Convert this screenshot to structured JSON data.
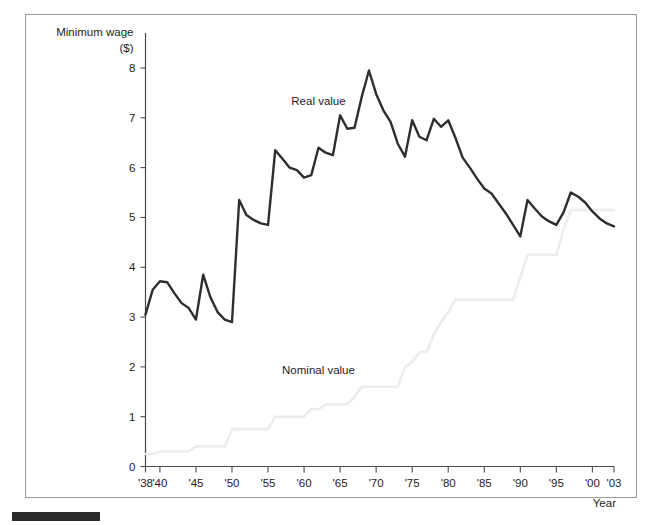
{
  "chart_data": {
    "type": "line",
    "title": "",
    "ylabel": "Minimum wage ($)",
    "ylabel_line1": "Minimum wage",
    "ylabel_line2": "($)",
    "xlabel": "Year",
    "xlim": [
      1938,
      2003
    ],
    "ylim": [
      0,
      8.3
    ],
    "grid": false,
    "legend_position": "inline-annotations",
    "y_ticks": [
      "0",
      "1",
      "2",
      "3",
      "4",
      "5",
      "6",
      "7",
      "8"
    ],
    "y_tick_values": [
      0,
      1,
      2,
      3,
      4,
      5,
      6,
      7,
      8
    ],
    "x_ticks": [
      "'38",
      "'40",
      "'45",
      "'50",
      "'55",
      "'60",
      "'65",
      "'70",
      "'75",
      "'80",
      "'85",
      "'90",
      "'95",
      "'00",
      "'03"
    ],
    "x_tick_values": [
      1938,
      1940,
      1945,
      1950,
      1955,
      1960,
      1965,
      1970,
      1975,
      1980,
      1985,
      1990,
      1995,
      2000,
      2003
    ],
    "colors": {
      "real": "#2e2e2e",
      "nominal": "#ececed",
      "axis": "#4a4a4a",
      "frame": "#9a9a9a",
      "text": "#1d1d1d"
    },
    "annotations": [
      {
        "name": "real-value-label",
        "text": "Real value",
        "x": 1962,
        "y": 7.25
      },
      {
        "name": "nominal-value-label",
        "text": "Nominal value",
        "x": 1962,
        "y": 1.85
      }
    ],
    "x": [
      1938,
      1939,
      1940,
      1941,
      1942,
      1943,
      1944,
      1945,
      1946,
      1947,
      1948,
      1949,
      1950,
      1951,
      1952,
      1953,
      1954,
      1955,
      1956,
      1957,
      1958,
      1959,
      1960,
      1961,
      1962,
      1963,
      1964,
      1965,
      1966,
      1967,
      1968,
      1969,
      1970,
      1971,
      1972,
      1973,
      1974,
      1975,
      1976,
      1977,
      1978,
      1979,
      1980,
      1981,
      1982,
      1983,
      1984,
      1985,
      1986,
      1987,
      1988,
      1989,
      1990,
      1991,
      1992,
      1993,
      1994,
      1995,
      1996,
      1997,
      1998,
      1999,
      2000,
      2001,
      2002,
      2003
    ],
    "series": [
      {
        "name": "Real value",
        "color": "#2e2e2e",
        "values": [
          3.05,
          3.55,
          3.72,
          3.7,
          3.48,
          3.28,
          3.18,
          2.95,
          3.85,
          3.4,
          3.1,
          2.95,
          2.9,
          5.35,
          5.05,
          4.95,
          4.88,
          4.85,
          6.35,
          6.18,
          6.0,
          5.95,
          5.8,
          5.85,
          6.4,
          6.3,
          6.25,
          7.05,
          6.78,
          6.8,
          7.42,
          7.95,
          7.48,
          7.15,
          6.92,
          6.48,
          6.22,
          6.95,
          6.62,
          6.55,
          6.98,
          6.82,
          6.95,
          6.6,
          6.2,
          6.0,
          5.78,
          5.58,
          5.48,
          5.28,
          5.08,
          4.85,
          4.62,
          5.35,
          5.18,
          5.02,
          4.92,
          4.85,
          5.1,
          5.5,
          5.42,
          5.3,
          5.12,
          4.98,
          4.88,
          4.82
        ],
        "note": "Inflation-adjusted (real) minimum wage in constant dollars; peak 7.95 in 1969, trough 2.90 in 1950"
      },
      {
        "name": "Nominal value",
        "color": "#ececed",
        "values": [
          0.25,
          0.25,
          0.3,
          0.3,
          0.3,
          0.3,
          0.3,
          0.4,
          0.4,
          0.4,
          0.4,
          0.4,
          0.75,
          0.75,
          0.75,
          0.75,
          0.75,
          0.75,
          1.0,
          1.0,
          1.0,
          1.0,
          1.0,
          1.15,
          1.15,
          1.25,
          1.25,
          1.25,
          1.25,
          1.4,
          1.6,
          1.6,
          1.6,
          1.6,
          1.6,
          1.6,
          2.0,
          2.1,
          2.3,
          2.3,
          2.65,
          2.9,
          3.1,
          3.35,
          3.35,
          3.35,
          3.35,
          3.35,
          3.35,
          3.35,
          3.35,
          3.35,
          3.8,
          4.25,
          4.25,
          4.25,
          4.25,
          4.25,
          4.75,
          5.15,
          5.15,
          5.15,
          5.15,
          5.15,
          5.15,
          5.15
        ],
        "note": "Nominal (current-dollar) statutory minimum wage; step function"
      }
    ]
  }
}
